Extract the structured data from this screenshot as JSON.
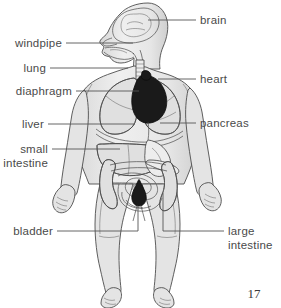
{
  "figure": {
    "page_number": "17",
    "labels": [
      {
        "id": "brain",
        "text": "brain",
        "text2": "",
        "side": "right"
      },
      {
        "id": "windpipe",
        "text": "windpipe",
        "text2": "",
        "side": "left"
      },
      {
        "id": "lung",
        "text": "lung",
        "text2": "",
        "side": "left"
      },
      {
        "id": "heart",
        "text": "heart",
        "text2": "",
        "side": "right"
      },
      {
        "id": "diaphragm",
        "text": "diaphragm",
        "text2": "",
        "side": "left"
      },
      {
        "id": "liver",
        "text": "liver",
        "text2": "",
        "side": "left"
      },
      {
        "id": "pancreas",
        "text": "pancreas",
        "text2": "",
        "side": "right"
      },
      {
        "id": "small-intestine",
        "text": "small",
        "text2": "intestine",
        "side": "left"
      },
      {
        "id": "bladder",
        "text": "bladder",
        "text2": "",
        "side": "left"
      },
      {
        "id": "large-intestine",
        "text": "large",
        "text2": "intestine",
        "side": "right"
      }
    ],
    "colors": {
      "background": "#ffffff",
      "label_text": "#4a4a4a",
      "leader_line": "#555555",
      "body_fill": "#ececec",
      "outline": "#4d4d4d",
      "organ_fill": "#e0e0e0",
      "heart_fill": "#1a1a1a",
      "bladder_fill": "#2a2a2a",
      "page_number": "#3a3a3a"
    }
  }
}
